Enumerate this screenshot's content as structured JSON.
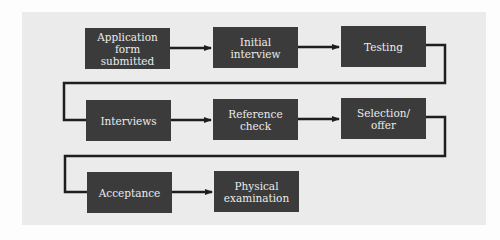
{
  "diagram": {
    "type": "flowchart",
    "colors": {
      "background": "#fdfdfd",
      "panel": "#ebebeb",
      "box_fill": "#3b3b3b",
      "box_text": "#ececec",
      "connector": "#1e1e1e"
    },
    "steps": [
      {
        "id": "application",
        "label": "Application\nform submitted",
        "row": 1,
        "col": 1
      },
      {
        "id": "initial-interview",
        "label": "Initial\ninterview",
        "row": 1,
        "col": 2
      },
      {
        "id": "testing",
        "label": "Testing",
        "row": 1,
        "col": 3
      },
      {
        "id": "interviews",
        "label": "Interviews",
        "row": 2,
        "col": 1
      },
      {
        "id": "reference-check",
        "label": "Reference\ncheck",
        "row": 2,
        "col": 2
      },
      {
        "id": "selection-offer",
        "label": "Selection/\noffer",
        "row": 2,
        "col": 3
      },
      {
        "id": "acceptance",
        "label": "Acceptance",
        "row": 3,
        "col": 1
      },
      {
        "id": "physical-examination",
        "label": "Physical\nexamination",
        "row": 3,
        "col": 2
      }
    ],
    "edges": [
      [
        "application",
        "initial-interview"
      ],
      [
        "initial-interview",
        "testing"
      ],
      [
        "testing",
        "interviews"
      ],
      [
        "interviews",
        "reference-check"
      ],
      [
        "reference-check",
        "selection-offer"
      ],
      [
        "selection-offer",
        "acceptance"
      ],
      [
        "acceptance",
        "physical-examination"
      ]
    ]
  }
}
